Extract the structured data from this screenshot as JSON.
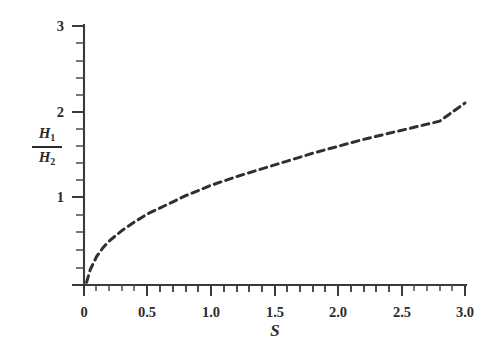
{
  "figure": {
    "title": "",
    "background_color": "#ffffff",
    "ink_color": "#303030"
  },
  "axes": {
    "x": {
      "label": "S",
      "tick_labels": [
        "0",
        "0.5",
        "1.0",
        "1.5",
        "2.0",
        "2.5",
        "3.0"
      ],
      "tick_values": [
        0,
        0.5,
        1.0,
        1.5,
        2.0,
        2.5,
        3.0
      ],
      "range": [
        0,
        3.0
      ],
      "minor_tick_step": 0.1
    },
    "y": {
      "label_numerator": "H",
      "label_numerator_sub": "1",
      "label_denominator": "H",
      "label_denominator_sub": "2",
      "label_plain": "H1/H2",
      "tick_labels": [
        "1",
        "2",
        "3"
      ],
      "tick_values": [
        1,
        2,
        3
      ],
      "range": [
        0,
        3.0
      ],
      "minor_tick_step": 0.2
    }
  },
  "chart_data": {
    "type": "line",
    "title": "",
    "xlabel": "S",
    "ylabel": "H1/H2",
    "xlim": [
      0,
      3.0
    ],
    "ylim": [
      0,
      3.0
    ],
    "grid": false,
    "legend": null,
    "line_style": "dashed",
    "series": [
      {
        "name": "H1/H2 vs S",
        "x": [
          0.02,
          0.05,
          0.1,
          0.15,
          0.2,
          0.3,
          0.4,
          0.5,
          0.6,
          0.7,
          0.8,
          0.9,
          1.0,
          1.2,
          1.4,
          1.6,
          1.8,
          2.0,
          2.2,
          2.4,
          2.6,
          2.8,
          3.0
        ],
        "y": [
          0.03,
          0.18,
          0.33,
          0.43,
          0.51,
          0.63,
          0.73,
          0.82,
          0.89,
          0.96,
          1.03,
          1.09,
          1.15,
          1.25,
          1.34,
          1.43,
          1.52,
          1.6,
          1.68,
          1.75,
          1.82,
          1.89,
          2.1
        ]
      }
    ]
  },
  "x_tick_positions_px": [
    84,
    147,
    211,
    275,
    338,
    402,
    465
  ],
  "y_tick_positions_px": [
    285,
    197,
    112,
    25
  ]
}
